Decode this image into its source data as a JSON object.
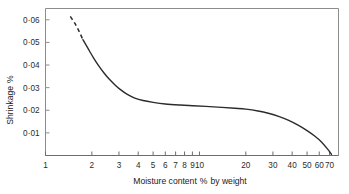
{
  "chart_data": {
    "type": "line",
    "title": "",
    "xlabel": "Moisture content % by weight",
    "ylabel": "Shrinkage %",
    "xscale": "log",
    "yscale": "linear",
    "xlim": [
      1,
      80
    ],
    "ylim": [
      0,
      0.065
    ],
    "grid": false,
    "legend": null,
    "xticks": [
      1,
      2,
      3,
      4,
      5,
      6,
      7,
      8,
      9,
      10,
      20,
      30,
      40,
      50,
      60,
      70
    ],
    "xticklabels": [
      "1",
      "2",
      "3",
      "4",
      "5",
      "6",
      "7",
      "8",
      "9",
      "10",
      "20",
      "30",
      "40",
      "50",
      "60",
      "70"
    ],
    "yticks": [
      0.01,
      0.02,
      0.03,
      0.04,
      0.05,
      0.06
    ],
    "yticklabels": [
      "0·01",
      "0·02",
      "0·03",
      "0·04",
      "0·05",
      "0·06"
    ],
    "series": [
      {
        "name": "shrinkage-vs-moisture",
        "style": "dashed-then-solid",
        "dashed_segment": {
          "note": "extrapolated portion at low moisture",
          "x": [
            1.45,
            1.55,
            1.65,
            1.75
          ],
          "y": [
            0.0615,
            0.0585,
            0.055,
            0.0512
          ]
        },
        "solid_segment": {
          "x": [
            1.75,
            1.9,
            2.05,
            2.2,
            2.4,
            2.6,
            2.85,
            3.1,
            3.4,
            3.8,
            4.3,
            5.0,
            6.0,
            7.5,
            9.0,
            11.0,
            14.0,
            17.0,
            20.0,
            24.0,
            28.0,
            33.0,
            38.0,
            44.0,
            50.0,
            56.0,
            62.0,
            68.0,
            72.0
          ],
          "y": [
            0.0512,
            0.047,
            0.0432,
            0.04,
            0.0365,
            0.0337,
            0.031,
            0.0289,
            0.027,
            0.0254,
            0.0243,
            0.0235,
            0.0228,
            0.0223,
            0.022,
            0.0217,
            0.0213,
            0.0209,
            0.0205,
            0.0197,
            0.0187,
            0.0172,
            0.0155,
            0.0133,
            0.011,
            0.0086,
            0.006,
            0.0028,
            0.0005
          ]
        }
      }
    ]
  },
  "axis": {
    "y_title_text": "Shrinkage",
    "y_title_symbol": "%",
    "x_title_prefix": "Moisture content",
    "x_title_symbol": "%",
    "x_title_suffix": "by weight"
  },
  "colors": {
    "curve": "#2b2b2b",
    "frame": "#8c8c8c",
    "text": "#1a1a1a",
    "background": "#ffffff"
  }
}
